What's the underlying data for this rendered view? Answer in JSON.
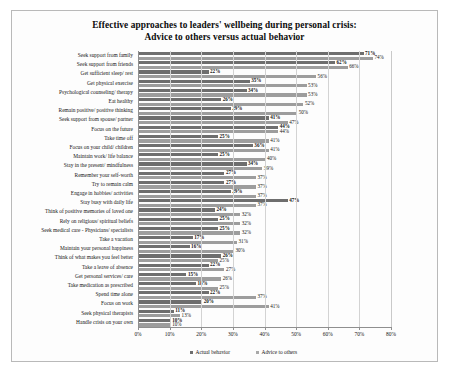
{
  "chart_data": {
    "type": "bar",
    "orientation": "horizontal",
    "title": "Effective approaches to leaders' wellbeing during personal crisis:\nAdvice to others versus actual behavior",
    "title_line1": "Effective approaches to leaders' wellbeing during personal crisis:",
    "title_line2": "Advice to others versus actual behavior",
    "xlabel": "",
    "ylabel": "",
    "xlim": [
      0,
      80
    ],
    "xticks": [
      0,
      10,
      20,
      30,
      40,
      50,
      60,
      70,
      80
    ],
    "xtick_labels": [
      "0%",
      "10%",
      "20%",
      "30%",
      "40%",
      "50%",
      "60%",
      "70%",
      "80%"
    ],
    "grid": "vertical",
    "legend_position": "bottom",
    "legend": [
      "Actual behavior",
      "Advice to others"
    ],
    "value_suffix": "%",
    "colors": {
      "actual_behavior": "#6e6e6e",
      "advice_to_others": "#9d9d9d",
      "grid": "#d3d3d3",
      "axis": "#8f8f8f",
      "text": "#151515",
      "background": "#ffffff"
    },
    "categories": [
      "Seek support from family",
      "Seek support from friends",
      "Get sufficient sleep/ rest",
      "Get physical exercise",
      "Psychological counseling/ therapy",
      "Eat healthy",
      "Remain positive/ positive thinking",
      "Seek support from spouse/ partner",
      "Focus on the future",
      "Take time off",
      "Focus on your child/ children",
      "Maintain work/ life balance",
      "Stay in the present/ mindfulness",
      "Remember your self-worth",
      "Try to remain calm",
      "Engage in hobbies/ activities",
      "Stay busy with daily life",
      "Think of positive memories of loved one",
      "Rely on religious/ spiritual beliefs",
      "Seek medical care -  Physicians/ specialists",
      "Take a vacation",
      "Maintain your personal happiness",
      "Think of what makes you feel better",
      "Take a leave of absence",
      "Get personal services/ care",
      "Take medication as prescribed",
      "Spend time alone",
      "Focus on work",
      "Seek physical therapists",
      "Handle crisis on your own"
    ],
    "series": [
      {
        "name": "Actual behavior",
        "values": [
          71,
          62,
          22,
          35,
          34,
          26,
          29,
          41,
          44,
          25,
          36,
          25,
          34,
          27,
          27,
          29,
          47,
          24,
          25,
          25,
          17,
          16,
          26,
          22,
          15,
          18,
          22,
          20,
          11,
          10
        ]
      },
      {
        "name": "Advice to others",
        "values": [
          74,
          66,
          56,
          53,
          53,
          52,
          50,
          47,
          44,
          41,
          41,
          40,
          39,
          37,
          37,
          37,
          37,
          32,
          32,
          32,
          31,
          30,
          25,
          27,
          26,
          25,
          37,
          41,
          13,
          10
        ]
      }
    ]
  }
}
